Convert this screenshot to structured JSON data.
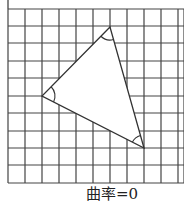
{
  "figure": {
    "caption": "曲率=0",
    "grid": {
      "left": 8,
      "top": 9,
      "cell": 17.2,
      "cols": 10,
      "rows": 10,
      "x_lines": [
        8,
        25,
        42,
        59,
        76,
        93,
        110,
        127,
        144,
        161,
        178,
        184
      ],
      "y_lines": [
        9,
        26,
        43,
        61,
        78,
        96,
        113,
        131,
        148,
        165,
        183
      ],
      "line_color": "#444444"
    },
    "triangle": {
      "vertices": [
        {
          "name": "top",
          "x": 110,
          "y": 27
        },
        {
          "name": "left",
          "x": 42,
          "y": 96
        },
        {
          "name": "bottom",
          "x": 144,
          "y": 148
        }
      ],
      "stroke": "#333333",
      "fill": "#ffffff",
      "angle_arc_radius": 13
    }
  }
}
